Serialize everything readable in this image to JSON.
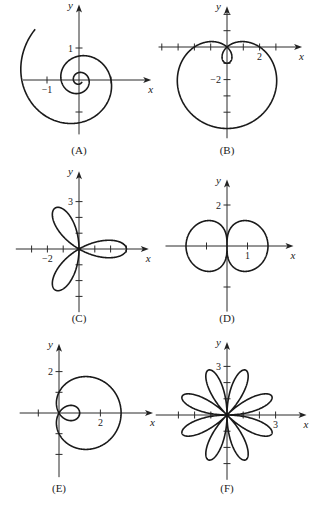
{
  "chart_data": [
    {
      "type": "line",
      "panel": "A",
      "caption": "(A)",
      "polar": "spiral",
      "xlabel": "x",
      "ylabel": "y",
      "x_tick_labels": [
        {
          "value": -1,
          "label": "−1"
        }
      ],
      "y_tick_labels": [
        {
          "value": 1,
          "label": "1"
        }
      ],
      "x_ticks": [
        -1,
        1
      ],
      "y_ticks": [
        1,
        -1
      ],
      "layout": {
        "ox": 79,
        "oy": 80,
        "scale": 32,
        "xmin": -1.75,
        "xmax": 2.1,
        "ymin": -1.7,
        "ymax": 2.2,
        "cap_y": 154
      },
      "curve": {
        "kind": "exp_spiral",
        "a": 1.0,
        "k": -0.185,
        "theta_start": 12.0,
        "theta_end": -4.0
      }
    },
    {
      "type": "line",
      "panel": "B",
      "caption": "(B)",
      "polar": "limacon r = 2 - 3 sin θ",
      "xlabel": "x",
      "ylabel": "y",
      "x_tick_labels": [
        {
          "value": 2,
          "label": "2"
        }
      ],
      "y_tick_labels": [
        {
          "value": -2,
          "label": "−2"
        }
      ],
      "x_ticks": [
        -4,
        -3,
        -2,
        -1,
        1,
        2,
        3
      ],
      "y_ticks": [
        2,
        1,
        -1,
        -2,
        -3,
        -4,
        -5
      ],
      "layout": {
        "ox": 227,
        "oy": 47,
        "scale": 16.3,
        "xmin": -4.2,
        "xmax": 4.3,
        "ymin": -5.6,
        "ymax": 2.2,
        "cap_y": 154
      },
      "curve": {
        "kind": "limacon_sin",
        "a": 2,
        "b": -3
      }
    },
    {
      "type": "line",
      "panel": "C",
      "caption": "(C)",
      "polar": "rose r = 3 cos 3θ",
      "xlabel": "x",
      "ylabel": "y",
      "x_tick_labels": [
        {
          "value": -2,
          "label": "−2"
        }
      ],
      "y_tick_labels": [
        {
          "value": 3,
          "label": "3"
        }
      ],
      "x_ticks": [
        -3,
        -2,
        -1,
        1,
        2,
        3
      ],
      "y_ticks": [
        3,
        2,
        1,
        -1,
        -2,
        -3
      ],
      "layout": {
        "ox": 79,
        "oy": 249,
        "scale": 15.8,
        "xmin": -4.0,
        "xmax": 4.1,
        "ymin": -4.0,
        "ymax": 4.6,
        "cap_y": 322
      },
      "curve": {
        "kind": "rose_cos",
        "a": 3,
        "n": 3
      }
    },
    {
      "type": "line",
      "panel": "D",
      "caption": "(D)",
      "polar": "peanut r² ∝ |cos θ|",
      "xlabel": "x",
      "ylabel": "y",
      "x_tick_labels": [
        {
          "value": 1,
          "label": "1"
        }
      ],
      "y_tick_labels": [
        {
          "value": 2,
          "label": "2"
        }
      ],
      "x_ticks": [
        -1,
        1
      ],
      "y_ticks": [
        2,
        -2
      ],
      "layout": {
        "ox": 227,
        "oy": 246,
        "scale": 20.5,
        "xmin": -3.0,
        "xmax": 3.0,
        "ymin": -3.2,
        "ymax": 3.0,
        "cap_y": 322
      },
      "curve": {
        "kind": "sqrtcos",
        "a": 2
      }
    },
    {
      "type": "line",
      "panel": "E",
      "caption": "(E)",
      "polar": "limacon r = 1 + 2 cos θ",
      "xlabel": "x",
      "ylabel": "y",
      "x_tick_labels": [
        {
          "value": 2,
          "label": "2"
        }
      ],
      "y_tick_labels": [
        {
          "value": 2,
          "label": "2"
        }
      ],
      "x_ticks": [
        -1,
        2
      ],
      "y_ticks": [
        2,
        1,
        -1,
        -2
      ],
      "layout": {
        "ox": 59,
        "oy": 413,
        "scale": 20.7,
        "xmin": -1.9,
        "xmax": 4.3,
        "ymin": -3.1,
        "ymax": 3.1,
        "cap_y": 492
      },
      "curve": {
        "kind": "limacon_cos",
        "a": 1,
        "b": 2
      }
    },
    {
      "type": "line",
      "panel": "F",
      "caption": "(F)",
      "polar": "rose r = 3 sin 4θ",
      "xlabel": "x",
      "ylabel": "y",
      "x_tick_labels": [
        {
          "value": 3,
          "label": "3"
        }
      ],
      "y_tick_labels": [
        {
          "value": 3,
          "label": "3"
        }
      ],
      "x_ticks": [
        -3,
        -2,
        -1,
        1,
        2,
        3
      ],
      "y_ticks": [
        3,
        2,
        1,
        -1,
        -2,
        -3
      ],
      "layout": {
        "ox": 227,
        "oy": 415,
        "scale": 16.2,
        "xmin": -4.4,
        "xmax": 4.6,
        "ymin": -4.0,
        "ymax": 4.2,
        "cap_y": 492
      },
      "curve": {
        "kind": "rose_sin",
        "a": 3,
        "n": 4
      }
    }
  ]
}
